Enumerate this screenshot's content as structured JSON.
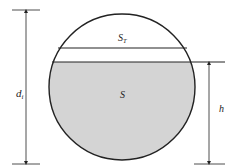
{
  "diagram": {
    "labels": {
      "diameter": "d",
      "diameter_sub": "i",
      "top_segment": "S",
      "top_segment_sub": "T",
      "liquid_area": "S",
      "liquid_height": "h"
    },
    "colors": {
      "liquid_fill": "#d4d4d4",
      "stroke": "#222222",
      "background": "#ffffff"
    }
  }
}
